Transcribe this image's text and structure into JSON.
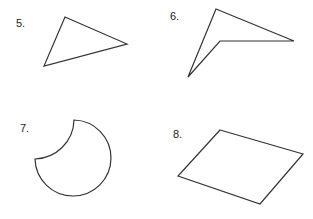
{
  "problems": [
    {
      "number": "5.",
      "shape": "triangle"
    },
    {
      "number": "6.",
      "shape": "concave-quadrilateral"
    },
    {
      "number": "7.",
      "shape": "circle-with-concave-arc"
    },
    {
      "number": "8.",
      "shape": "parallelogram"
    }
  ],
  "colors": {
    "stroke": "#333333",
    "background": "#ffffff"
  }
}
